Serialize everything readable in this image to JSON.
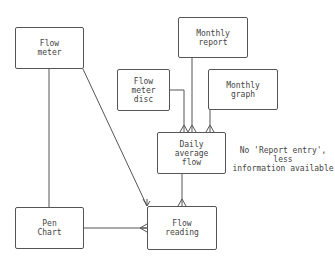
{
  "diagram": {
    "type": "entity-relationship",
    "entities": [
      {
        "id": "flow_meter",
        "label": "Flow\nmeter"
      },
      {
        "id": "flow_meter_disc",
        "label": "Flow\nmeter\ndisc"
      },
      {
        "id": "monthly_report",
        "label": "Monthly\nreport"
      },
      {
        "id": "monthly_graph",
        "label": "Monthly\ngraph"
      },
      {
        "id": "daily_average_flow",
        "label": "Daily\naverage\nflow"
      },
      {
        "id": "pen_chart",
        "label": "Pen\nChart"
      },
      {
        "id": "flow_reading",
        "label": "Flow\nreading"
      }
    ],
    "relationships": [
      {
        "from": "flow_meter",
        "to": "pen_chart",
        "cardinality": "one-to-one"
      },
      {
        "from": "flow_meter",
        "to": "flow_reading",
        "cardinality": "one-to-many"
      },
      {
        "from": "pen_chart",
        "to": "flow_reading",
        "cardinality": "one-to-many"
      },
      {
        "from": "flow_meter_disc",
        "to": "daily_average_flow",
        "cardinality": "one-to-many"
      },
      {
        "from": "monthly_report",
        "to": "daily_average_flow",
        "cardinality": "one-to-many"
      },
      {
        "from": "monthly_graph",
        "to": "daily_average_flow",
        "cardinality": "one-to-many"
      },
      {
        "from": "daily_average_flow",
        "to": "flow_reading",
        "cardinality": "one-to-many"
      }
    ],
    "note": "No 'Report entry', less\ninformation available"
  }
}
